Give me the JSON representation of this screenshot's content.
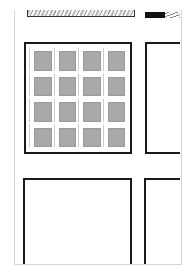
{
  "page": {
    "type": "sketched comic/layout page",
    "background": "#ffffff",
    "border_color": "#d6d6d6"
  },
  "top_row": {
    "strip": {
      "description": "hatched sketch strip at top",
      "fill": "#bbbbbb"
    },
    "black_bar": {
      "color": "#111111"
    },
    "scribble": {
      "color": "#888888"
    }
  },
  "middle_row": {
    "grid_panel": {
      "rows": 4,
      "cols": 4,
      "tile_color": "#a9a9a9",
      "description": "4x4 grid of gray beveled squares"
    },
    "right_panel": {
      "description": "empty panel, cut off at right edge"
    }
  },
  "bottom_row": {
    "left_panel": {
      "description": "empty panel, cut off at bottom"
    },
    "right_panel": {
      "description": "empty panel, cut off at right and bottom"
    }
  },
  "stroke_color": "#1a1a1a"
}
